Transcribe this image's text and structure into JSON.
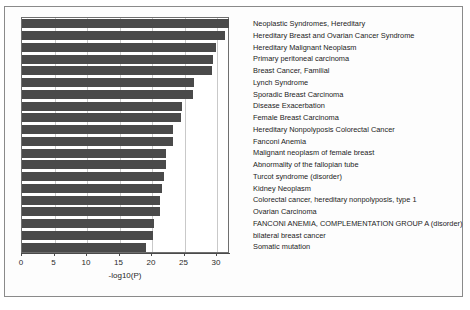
{
  "chart_data": {
    "type": "bar",
    "orientation": "horizontal",
    "title": "",
    "xlabel": "-log10(P)",
    "ylabel": "",
    "xlim": [
      0,
      32
    ],
    "xticks": [
      0,
      5,
      10,
      15,
      20,
      25,
      30
    ],
    "grid": true,
    "grid_axis": "x",
    "legend": "none",
    "bar_color": "#4a4a4a",
    "categories": [
      "Neoplastic Syndromes, Hereditary",
      "Hereditary Breast and Ovarian Cancer Syndrome",
      "Hereditary Malignant Neoplasm",
      "Primary peritoneal carcinoma",
      "Breast Cancer, Familial",
      "Lynch Syndrome",
      "Sporadic Breast Carcinoma",
      "Disease Exacerbation",
      "Female Breast Carcinoma",
      "Hereditary Nonpolyposis Colorectal Cancer",
      "Fanconi Anemia",
      "Malignant neoplasm of female breast",
      "Abnormality of the fallopian tube",
      "Turcot syndrome (disorder)",
      "Kidney Neoplasm",
      "Colorectal cancer, hereditary nonpolyposis, type 1",
      "Ovarian Carcinoma",
      "FANCONI ANEMIA, COMPLEMENTATION GROUP A (disorder)",
      "bilateral breast cancer",
      "Somatic mutation"
    ],
    "values": [
      31.9,
      31.2,
      29.8,
      29.4,
      29.2,
      26.4,
      26.3,
      24.6,
      24.5,
      23.3,
      23.2,
      22.2,
      22.1,
      21.8,
      21.6,
      21.3,
      21.2,
      20.3,
      20.2,
      19.1
    ]
  }
}
